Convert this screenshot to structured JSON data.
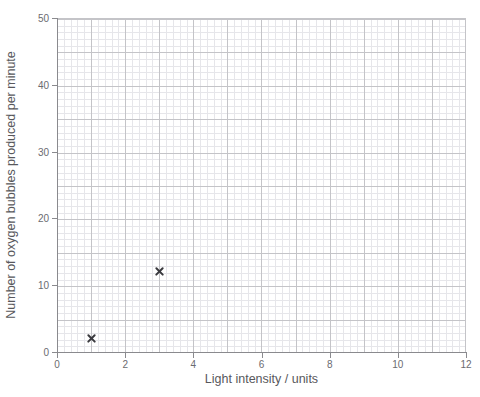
{
  "chart_data": {
    "type": "scatter",
    "title": "",
    "xlabel": "Light intensity / units",
    "ylabel": "Number of oxygen bubbles produced per minute",
    "xlim": [
      0,
      12
    ],
    "ylim": [
      0,
      50
    ],
    "xticks": [
      0,
      2,
      4,
      6,
      8,
      10,
      12
    ],
    "yticks": [
      0,
      10,
      20,
      30,
      40,
      50
    ],
    "xtick_labels": [
      "0",
      "2",
      "4",
      "6",
      "8",
      "10",
      "12"
    ],
    "ytick_labels": [
      "0",
      "10",
      "20",
      "30",
      "40",
      "50"
    ],
    "x_minor_step": 0.2,
    "y_minor_step": 1,
    "grid": true,
    "legend": null,
    "marker": "x",
    "marker_color": "#3a3a3e",
    "grid_major_color": "#c4c4c8",
    "grid_minor_color": "#e6e6ea",
    "axis_color": "#8a8a8e",
    "background": "#ffffff",
    "points": [
      {
        "x": 1,
        "y": 2
      },
      {
        "x": 3,
        "y": 12
      }
    ]
  }
}
